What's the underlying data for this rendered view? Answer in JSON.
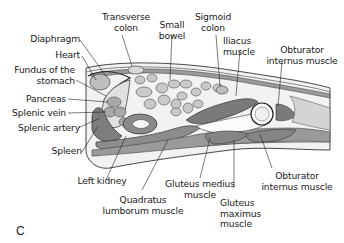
{
  "figure": {
    "panel_letter": "C",
    "labels": {
      "transverse_colon": [
        "Transverse",
        "colon"
      ],
      "small_bowel": [
        "Small",
        "bowel"
      ],
      "sigmoid_colon": [
        "Sigmoid",
        "colon"
      ],
      "iliacus_muscle": [
        "Iliacus",
        "muscle"
      ],
      "obturator_internus_top": [
        "Obturator",
        "internus muscle"
      ],
      "diaphragm": [
        "Diaphragm"
      ],
      "heart": [
        "Heart"
      ],
      "fundus": [
        "Fundus of the",
        "stomach"
      ],
      "pancreas": [
        "Pancreas"
      ],
      "splenic_vein": [
        "Splenic vein"
      ],
      "splenic_artery": [
        "Splenic artery"
      ],
      "spleen": [
        "Spleen"
      ],
      "left_kidney": [
        "Left kidney"
      ],
      "quadratus_lumborum": [
        "Quadratus",
        "lumborum muscle"
      ],
      "gluteus_medius": [
        "Gluteus medius",
        "muscle"
      ],
      "gluteus_maximus": [
        "Gluteus",
        "maximus",
        "muscle"
      ],
      "obturator_internus_bottom": [
        "Obturator",
        "internus muscle"
      ]
    }
  }
}
